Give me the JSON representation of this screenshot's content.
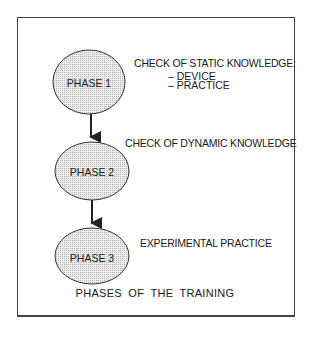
{
  "diagram": {
    "caption": "PHASES  OF  THE  TRAINING",
    "phases": [
      {
        "label": "PHASE  1",
        "description": "CHECK OF STATIC KNOWLEDGE:",
        "subitems": [
          "– DEVICE",
          "– PRACTICE"
        ]
      },
      {
        "label": "PHASE 2",
        "description": "CHECK OF DYNAMIC KNOWLEDGE",
        "subitems": []
      },
      {
        "label": "PHASE 3",
        "description": "EXPERIMENTAL PRACTICE",
        "subitems": []
      }
    ],
    "edges": [
      {
        "from": "PHASE 1",
        "to": "PHASE 2"
      },
      {
        "from": "PHASE 2",
        "to": "PHASE 3"
      }
    ],
    "colors": {
      "stroke": "#333333",
      "node_fill": "#d8d8d8",
      "background": "#ffffff"
    }
  }
}
